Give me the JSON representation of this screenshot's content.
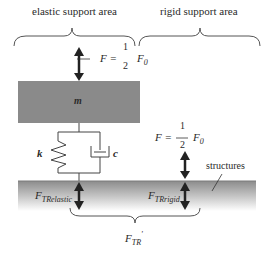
{
  "diagram": {
    "regions": {
      "elastic": "elastic support area",
      "rigid": "rigid support area"
    },
    "force_top": {
      "lhs": "F =",
      "num": "1",
      "den": "2",
      "rhs": "F",
      "rhs_sub": "0"
    },
    "force_rigid": {
      "lhs": "F =",
      "num": "1",
      "den": "2",
      "rhs": "F",
      "rhs_sub": "0"
    },
    "mass_label": "m",
    "spring_label": "k",
    "damper_label": "c",
    "structures_label": "structures",
    "transmitted": {
      "elastic": {
        "main": "F",
        "sub": "TRelastic"
      },
      "rigid": {
        "main": "F",
        "sub": "TRrigid"
      },
      "total": {
        "main": "F",
        "sub": "TR",
        "prime": "'"
      }
    },
    "colors": {
      "mass_fill": "#8a8a8a",
      "ground_top": "#8c8c8c",
      "ground_bottom": "#ffffff",
      "arrow": "#222222",
      "line": "#444444"
    }
  }
}
